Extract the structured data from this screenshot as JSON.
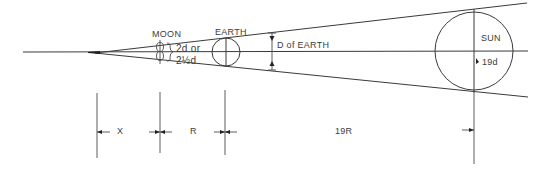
{
  "diagram": {
    "labels": {
      "moon": "MOON",
      "earth": "EARTH",
      "sun": "SUN",
      "moon_size_line1": "2d or",
      "moon_size_line2": "2½d",
      "earth_diameter": "D of EARTH",
      "sun_diameter": "19d",
      "dist_x": "X",
      "dist_r": "R",
      "dist_19r": "19R"
    },
    "colors": {
      "line": "#3a3a3a",
      "text": "#3c3c3c",
      "background": "#ffffff"
    }
  }
}
